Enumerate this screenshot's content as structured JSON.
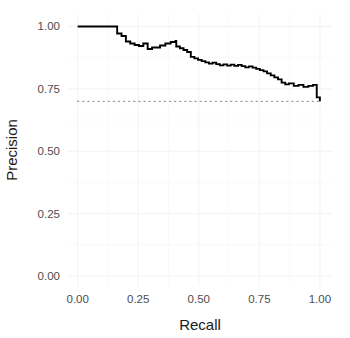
{
  "chart_data": {
    "type": "line",
    "title": "",
    "subtitle": "",
    "xlabel": "Recall",
    "ylabel": "Precision",
    "xlim": [
      -0.04,
      1.05
    ],
    "ylim": [
      -0.04,
      1.05
    ],
    "xticks": [
      0.0,
      0.25,
      0.5,
      0.75,
      1.0
    ],
    "xticklabels": [
      "0.00",
      "0.25",
      "0.50",
      "0.75",
      "1.00"
    ],
    "yticks": [
      0.0,
      0.25,
      0.5,
      0.75,
      1.0
    ],
    "yticklabels": [
      "0.00",
      "0.25",
      "0.50",
      "0.75",
      "1.00"
    ],
    "grid": true,
    "legend": "none",
    "series": [
      {
        "name": "precision-recall-curve",
        "style": "step",
        "color": "#000000",
        "x": [
          0.0,
          0.035,
          0.07,
          0.105,
          0.14,
          0.16,
          0.163,
          0.178,
          0.181,
          0.196,
          0.199,
          0.214,
          0.217,
          0.232,
          0.235,
          0.25,
          0.253,
          0.268,
          0.271,
          0.286,
          0.289,
          0.304,
          0.307,
          0.318,
          0.34,
          0.362,
          0.384,
          0.404,
          0.407,
          0.419,
          0.422,
          0.434,
          0.437,
          0.449,
          0.452,
          0.464,
          0.467,
          0.479,
          0.482,
          0.494,
          0.497,
          0.509,
          0.512,
          0.524,
          0.527,
          0.539,
          0.542,
          0.554,
          0.557,
          0.569,
          0.572,
          0.584,
          0.587,
          0.599,
          0.602,
          0.614,
          0.617,
          0.629,
          0.632,
          0.644,
          0.647,
          0.659,
          0.662,
          0.674,
          0.677,
          0.689,
          0.692,
          0.704,
          0.707,
          0.719,
          0.722,
          0.734,
          0.737,
          0.749,
          0.752,
          0.764,
          0.767,
          0.779,
          0.782,
          0.794,
          0.797,
          0.809,
          0.812,
          0.824,
          0.827,
          0.839,
          0.842,
          0.854,
          0.857,
          0.869,
          0.872,
          0.889,
          0.892,
          0.909,
          0.912,
          0.929,
          0.932,
          0.949,
          0.952,
          0.969,
          0.972,
          0.984,
          0.987,
          1.0
        ],
        "y": [
          1.0,
          1.0,
          1.0,
          1.0,
          1.0,
          1.0,
          0.972,
          0.972,
          0.962,
          0.962,
          0.94,
          0.94,
          0.932,
          0.932,
          0.926,
          0.926,
          0.922,
          0.922,
          0.932,
          0.932,
          0.91,
          0.91,
          0.916,
          0.916,
          0.924,
          0.932,
          0.938,
          0.942,
          0.92,
          0.92,
          0.913,
          0.913,
          0.906,
          0.906,
          0.898,
          0.898,
          0.878,
          0.878,
          0.872,
          0.872,
          0.866,
          0.866,
          0.861,
          0.861,
          0.856,
          0.856,
          0.851,
          0.851,
          0.855,
          0.855,
          0.849,
          0.849,
          0.844,
          0.844,
          0.848,
          0.848,
          0.843,
          0.843,
          0.847,
          0.847,
          0.842,
          0.842,
          0.846,
          0.846,
          0.841,
          0.841,
          0.836,
          0.836,
          0.84,
          0.84,
          0.835,
          0.835,
          0.83,
          0.83,
          0.825,
          0.825,
          0.82,
          0.82,
          0.812,
          0.812,
          0.804,
          0.804,
          0.796,
          0.796,
          0.788,
          0.788,
          0.775,
          0.775,
          0.768,
          0.768,
          0.772,
          0.772,
          0.762,
          0.762,
          0.766,
          0.766,
          0.758,
          0.758,
          0.762,
          0.762,
          0.766,
          0.766,
          0.716,
          0.7
        ]
      },
      {
        "name": "baseline",
        "style": "dotted-horizontal",
        "color": "#9a9a9a",
        "x": [
          0.0,
          1.0
        ],
        "y": [
          0.7,
          0.7
        ],
        "annotation": "no-skill baseline at precision 0.70"
      }
    ]
  },
  "axes": {
    "x_title": "Recall",
    "y_title": "Precision",
    "x_tick_labels": [
      "0.00",
      "0.25",
      "0.50",
      "0.75",
      "1.00"
    ],
    "y_tick_labels": [
      "0.00",
      "0.25",
      "0.50",
      "0.75",
      "1.00"
    ]
  },
  "colors": {
    "curve": "#000000",
    "baseline": "#9a9a9a",
    "grid_major": "#f2f2f2",
    "grid_minor": "#f8f8f8",
    "panel_background": "#ffffff",
    "tick_text": "#4d4d4d",
    "axis_title_text": "#1a1a1a"
  }
}
